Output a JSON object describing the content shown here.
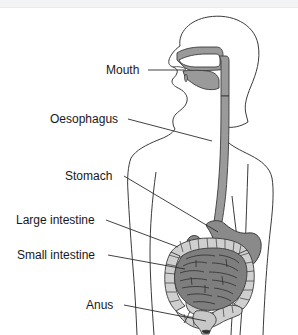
{
  "canvas": {
    "width": 298,
    "height": 335,
    "background": "#ffffff",
    "top_band_color": "#f2f3f5",
    "top_rule_color": "#e9eaec"
  },
  "colors": {
    "outline": "#3a3a3a",
    "leader_line": "#2b2b2b",
    "label_text": "#18181a",
    "body_fill": "#ffffff",
    "oral_cavity_fill": "#9a9a9a",
    "oesophagus_fill": "#9a9a9a",
    "stomach_fill": "#8a8a8a",
    "large_intestine_fill": "#cfcfcf",
    "small_intestine_fill": "#7e7e7e",
    "rectum_fill": "#c7c7c7",
    "anus_fill": "#333333"
  },
  "labels": [
    {
      "id": "mouth",
      "text": "Mouth",
      "x": 106,
      "y": 64,
      "leader_from": [
        148,
        70
      ],
      "leader_to": [
        186,
        70
      ]
    },
    {
      "id": "oesophagus",
      "text": "Oesophagus",
      "x": 50,
      "y": 113,
      "leader_from": [
        128,
        119
      ],
      "leader_to": [
        205,
        140
      ]
    },
    {
      "id": "stomach",
      "text": "Stomach",
      "x": 65,
      "y": 170,
      "leader_from": [
        124,
        176
      ],
      "leader_to": [
        215,
        231
      ]
    },
    {
      "id": "large-intestine",
      "text": "Large intestine",
      "x": 16,
      "y": 214,
      "leader_from": [
        106,
        220
      ],
      "leader_to": [
        176,
        246
      ]
    },
    {
      "id": "small-intestine",
      "text": "Small intestine",
      "x": 17,
      "y": 249,
      "leader_from": [
        108,
        255
      ],
      "leader_to": [
        181,
        268
      ]
    },
    {
      "id": "anus",
      "text": "Anus",
      "x": 86,
      "y": 299,
      "leader_from": [
        124,
        305
      ],
      "leader_to": [
        205,
        320
      ]
    }
  ],
  "organs": [
    {
      "id": "oral-cavity",
      "name": "Mouth / oral cavity",
      "fill": "#9a9a9a"
    },
    {
      "id": "oesophagus",
      "name": "Oesophagus",
      "fill": "#9a9a9a"
    },
    {
      "id": "stomach",
      "name": "Stomach",
      "fill": "#8a8a8a"
    },
    {
      "id": "large-intestine",
      "name": "Large intestine",
      "fill": "#cfcfcf"
    },
    {
      "id": "small-intestine",
      "name": "Small intestine",
      "fill": "#7e7e7e"
    },
    {
      "id": "rectum",
      "name": "Rectum",
      "fill": "#c7c7c7"
    },
    {
      "id": "anus",
      "name": "Anus",
      "fill": "#333333"
    }
  ]
}
